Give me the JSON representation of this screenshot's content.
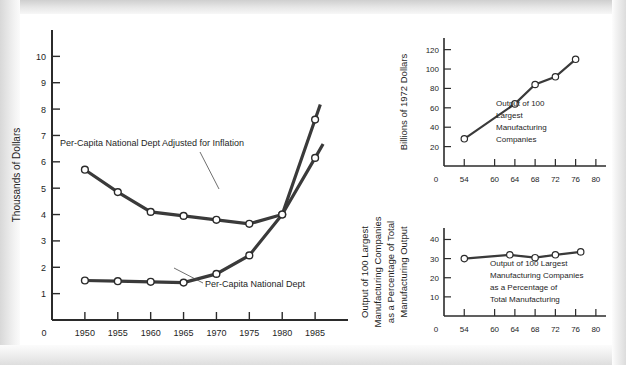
{
  "figure": {
    "background_color": "#ffffff",
    "ink_color": "#2b2b2b"
  },
  "chart_data": [
    {
      "id": "main",
      "type": "line",
      "title": "",
      "xlabel": "",
      "ylabel": "Thousands of Dollars",
      "xlim": [
        1945,
        1990
      ],
      "ylim": [
        0,
        11
      ],
      "grid": false,
      "legend": "inline-annotations",
      "x_ticks": [
        1950,
        1955,
        1960,
        1965,
        1970,
        1975,
        1980,
        1985
      ],
      "x_tick_labels": [
        "1950",
        "1955",
        "1960",
        "1965",
        "1970",
        "1975",
        "1980",
        "1985"
      ],
      "x_origin_label": "0",
      "y_ticks": [
        1,
        2,
        3,
        4,
        5,
        6,
        7,
        8,
        9,
        10
      ],
      "y_tick_labels": [
        "1",
        "2",
        "3",
        "4",
        "5",
        "6",
        "7",
        "8",
        "9",
        "10"
      ],
      "categories": [
        1950,
        1955,
        1960,
        1965,
        1970,
        1975,
        1980,
        1985
      ],
      "series": [
        {
          "name": "Per-Capita National Dept Adjusted for Inflation",
          "values": [
            5.7,
            4.85,
            4.1,
            3.95,
            3.8,
            3.65,
            4.0,
            6.15
          ],
          "annotation": "Per-Capita National Dept Adjusted for Inflation"
        },
        {
          "name": "Per-Capita National Dept",
          "values": [
            1.5,
            1.47,
            1.45,
            1.42,
            1.75,
            2.45,
            4.0,
            7.6
          ],
          "annotation": "Per-Capita National Dept"
        }
      ]
    },
    {
      "id": "top-right",
      "type": "line",
      "title": "",
      "xlabel": "",
      "ylabel": "Billions of 1972 Dollars",
      "xlim": [
        50,
        82
      ],
      "ylim": [
        0,
        132
      ],
      "grid": false,
      "x_ticks": [
        54,
        60,
        64,
        68,
        72,
        76,
        80
      ],
      "x_tick_labels": [
        "54",
        "60",
        "64",
        "68",
        "72",
        "76",
        "80"
      ],
      "x_origin_label": "0",
      "y_ticks": [
        20,
        40,
        60,
        80,
        100,
        120
      ],
      "y_tick_labels": [
        "20",
        "40",
        "60",
        "80",
        "100",
        "120"
      ],
      "annotation_lines": [
        "Output of 100",
        "Largest",
        "Manufacturing",
        "Companies"
      ],
      "x": [
        54,
        64,
        68,
        72,
        76
      ],
      "values": [
        28,
        64,
        84,
        92,
        110
      ]
    },
    {
      "id": "bottom-right",
      "type": "line",
      "title": "",
      "xlabel": "",
      "ylabel_lines": [
        "Output of 100 Largest",
        "Manufacturing Companies",
        "as a Percentage of Total",
        "Manufacturing Output"
      ],
      "xlim": [
        50,
        82
      ],
      "ylim": [
        0,
        46
      ],
      "grid": false,
      "x_ticks": [
        54,
        60,
        64,
        68,
        72,
        76,
        80
      ],
      "x_tick_labels": [
        "54",
        "60",
        "64",
        "68",
        "72",
        "76",
        "80"
      ],
      "x_origin_label": "0",
      "y_ticks": [
        10,
        20,
        30,
        40
      ],
      "y_tick_labels": [
        "10",
        "20",
        "30",
        "40"
      ],
      "annotation_lines": [
        "Output of 100 Largest",
        "Manufacturing Companies",
        "as a Percentage of",
        "Total Manufacturing"
      ],
      "x": [
        54,
        63,
        68,
        72,
        77
      ],
      "values": [
        30,
        32,
        30.5,
        32,
        33.5
      ]
    }
  ]
}
